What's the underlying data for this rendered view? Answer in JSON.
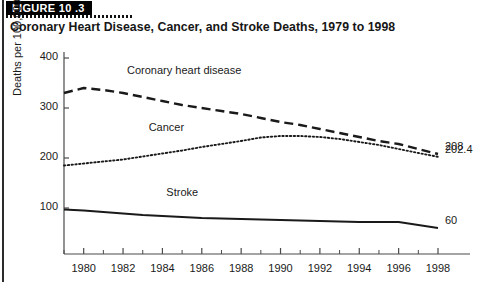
{
  "figure": {
    "band_label": "FIGURE 10 .3",
    "title": "Coronary Heart Disease, Cancer, and Stroke Deaths, 1979 to 1998"
  },
  "chart_data": {
    "type": "line",
    "title": "Coronary Heart Disease, Cancer, and Stroke Deaths, 1979 to 1998",
    "xlabel": "",
    "ylabel": "Deaths per 100,000",
    "ylabel_superscript": "a",
    "xlim": [
      1979,
      1998
    ],
    "ylim": [
      0,
      400
    ],
    "yticks": [
      100,
      200,
      300,
      400
    ],
    "xticks": [
      1980,
      1982,
      1984,
      1986,
      1988,
      1990,
      1992,
      1994,
      1996,
      1998
    ],
    "xticks_minor": [
      1979,
      1981,
      1983,
      1985,
      1987,
      1989,
      1991,
      1993,
      1995,
      1997
    ],
    "grid": false,
    "legend": "inline-labels",
    "x": [
      1979,
      1980,
      1981,
      1982,
      1983,
      1984,
      1985,
      1986,
      1987,
      1988,
      1989,
      1990,
      1991,
      1992,
      1993,
      1994,
      1995,
      1996,
      1997,
      1998
    ],
    "series": [
      {
        "name": "Coronary heart disease",
        "style": "dashed",
        "color": "#1a1a1a",
        "label_x": 1982.2,
        "label_y": 372,
        "end_label": "208",
        "values": [
          330,
          340,
          336,
          330,
          322,
          314,
          306,
          300,
          294,
          288,
          280,
          272,
          266,
          258,
          250,
          242,
          234,
          228,
          218,
          208
        ]
      },
      {
        "name": "Cancer",
        "style": "dotted",
        "color": "#1a1a1a",
        "label_x": 1983.3,
        "label_y": 258,
        "end_label": "202.4",
        "values": [
          185,
          189,
          193,
          197,
          203,
          209,
          215,
          222,
          228,
          234,
          241,
          244,
          244,
          242,
          238,
          232,
          226,
          218,
          210,
          202.4
        ]
      },
      {
        "name": "Stroke",
        "style": "solid",
        "color": "#1a1a1a",
        "label_x": 1984.2,
        "label_y": 128,
        "end_label": "60",
        "values": [
          97,
          95,
          92,
          89,
          86,
          84,
          82,
          80,
          79,
          78,
          77,
          76,
          75,
          74,
          73,
          72,
          72,
          72,
          66,
          60
        ]
      }
    ]
  }
}
